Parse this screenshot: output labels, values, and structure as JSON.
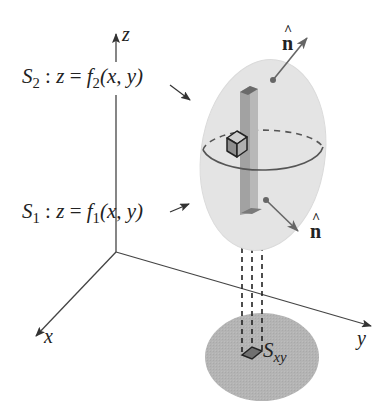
{
  "figure": {
    "type": "3d-surface-integral-diagram",
    "colors": {
      "ellipsoid_fill": "#e6e6e6",
      "ellipsoid_edge": "#d8d8d8",
      "equator": "#555555",
      "column_fill": "#aaaaaa",
      "column_top": "#6e6e6e",
      "cube_fill": "#bdbdbd",
      "disk_fill": "#b3b3b3",
      "axis": "#444444",
      "arrow": "#666666",
      "text": "#222222"
    }
  },
  "axes": {
    "x": {
      "label": "x"
    },
    "y": {
      "label": "y"
    },
    "z": {
      "label": "z"
    }
  },
  "surfaces": {
    "upper": {
      "name": "S",
      "subscript": "2",
      "separator": " : ",
      "var": "z",
      "equals": " = ",
      "func": "f",
      "func_subscript": "2",
      "args": "(x, y)"
    },
    "lower": {
      "name": "S",
      "subscript": "1",
      "separator": " : ",
      "var": "z",
      "equals": " = ",
      "func": "f",
      "func_subscript": "1",
      "args": "(x, y)"
    }
  },
  "normals": {
    "top": {
      "label": "n",
      "hat": "^"
    },
    "bottom": {
      "label": "n",
      "hat": "^"
    }
  },
  "projection": {
    "name": "S",
    "subscript": "xy"
  }
}
